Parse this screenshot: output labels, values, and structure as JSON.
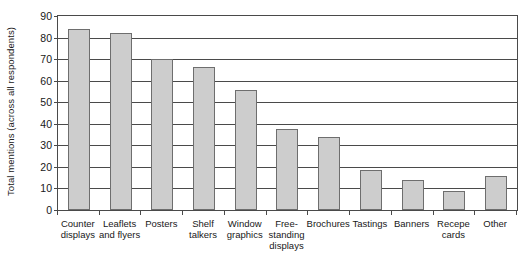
{
  "chart_data": {
    "type": "bar",
    "title": "",
    "xlabel": "",
    "ylabel": "Total mentions (across all respondents)",
    "ylim": [
      0,
      90
    ],
    "y_ticks": [
      0,
      10,
      20,
      30,
      40,
      50,
      60,
      70,
      80,
      90
    ],
    "grid": true,
    "legend": "none",
    "bar_color": "#cdcdcd",
    "bar_border_color": "#6e6e6e",
    "axis_color": "#4a4a4a",
    "categories": [
      "Counter displays",
      "Leaflets and flyers",
      "Posters",
      "Shelf talkers",
      "Window graphics",
      "Free-standing displays",
      "Brochures",
      "Tastings",
      "Banners",
      "Recepe cards",
      "Other"
    ],
    "category_lines": [
      [
        "Counter",
        "displays"
      ],
      [
        "Leaflets",
        "and flyers"
      ],
      [
        "Posters"
      ],
      [
        "Shelf",
        "talkers"
      ],
      [
        "Window",
        "graphics"
      ],
      [
        "Free-",
        "standing",
        "displays"
      ],
      [
        "Brochures"
      ],
      [
        "Tastings"
      ],
      [
        "Banners"
      ],
      [
        "Recepe",
        "cards"
      ],
      [
        "Other"
      ]
    ],
    "values": [
      84,
      82,
      70,
      66.5,
      55.5,
      37.5,
      34,
      18.5,
      14,
      9,
      16
    ]
  }
}
